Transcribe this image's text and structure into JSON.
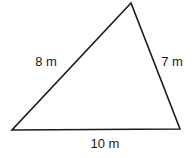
{
  "diagram": {
    "type": "triangle",
    "vertices": {
      "top": [
        131,
        3
      ],
      "bottom_left": [
        12,
        130
      ],
      "bottom_right": [
        180,
        129
      ]
    },
    "sides": [
      {
        "id": "left",
        "label": "8 m",
        "length": 8,
        "unit": "m"
      },
      {
        "id": "right",
        "label": "7 m",
        "length": 7,
        "unit": "m"
      },
      {
        "id": "bottom",
        "label": "10 m",
        "length": 10,
        "unit": "m"
      }
    ],
    "stroke_color": "#1a1a1a",
    "background_color": "#ffffff"
  }
}
